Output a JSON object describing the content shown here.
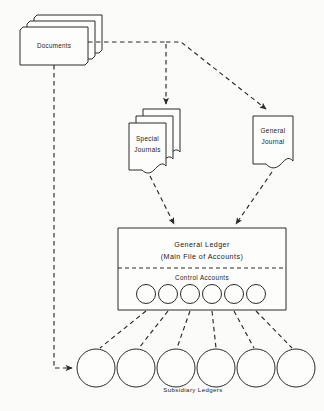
{
  "diagram": {
    "background_color": "#fbfbfa",
    "line_color": "#2b2b2b",
    "fill_color": "#fdfdfc"
  },
  "nodes": {
    "documents": {
      "label": "Documents",
      "shape": "stacked-sheets",
      "sheet_count": 3
    },
    "special_journals": {
      "label_line1": "Special",
      "label_line2": "Journals",
      "shape": "stacked-wavy-documents",
      "sheet_count": 3
    },
    "general_journal": {
      "label_line1": "General",
      "label_line2": "Journal",
      "shape": "wavy-document",
      "sheet_count": 1
    },
    "general_ledger": {
      "label_line1": "General Ledger",
      "label_line2": "(Main File of Accounts)",
      "control_accounts_label": "Control Accounts",
      "shape": "rectangle",
      "control_account_count": 6
    },
    "subsidiary_ledgers": {
      "label": "Subsidiary Ledgers",
      "shape": "circle-row",
      "count": 6
    }
  },
  "connectors": [
    {
      "name": "documents-to-special-journals",
      "style": "dashed",
      "arrow": true
    },
    {
      "name": "documents-to-general-journal",
      "style": "dashed",
      "arrow": true
    },
    {
      "name": "documents-to-subsidiary-ledgers",
      "style": "dashed",
      "arrow": true
    },
    {
      "name": "special-journals-to-general-ledger",
      "style": "dashed",
      "arrow": true
    },
    {
      "name": "general-journal-to-general-ledger",
      "style": "dashed",
      "arrow": true
    },
    {
      "name": "control-accounts-to-subsidiary-ledgers",
      "style": "dashed",
      "arrow": false
    }
  ]
}
